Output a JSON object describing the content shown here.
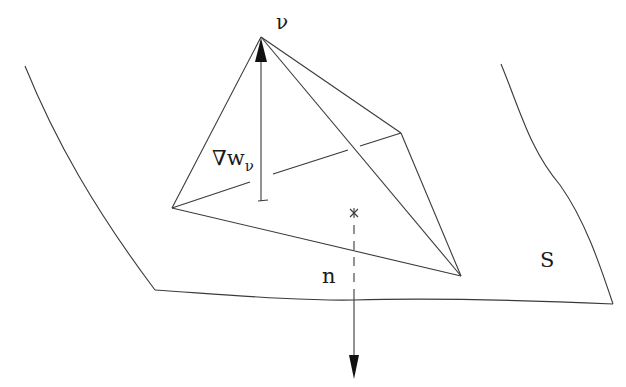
{
  "diagram": {
    "labels": {
      "apex": "ν",
      "gradient_symbol": "∇w",
      "gradient_subscript": "ν",
      "normal": "n",
      "surface": "S"
    },
    "colors": {
      "line": "#3a3a3a",
      "background": "#ffffff"
    },
    "vertices": {
      "apex_v": [
        261,
        37
      ],
      "left": [
        172,
        208
      ],
      "right_back": [
        401,
        133
      ],
      "bottom_right": [
        461,
        276
      ]
    },
    "markers": {
      "face_centroid": [
        354,
        213
      ],
      "gradient_base": [
        261,
        201
      ]
    }
  }
}
